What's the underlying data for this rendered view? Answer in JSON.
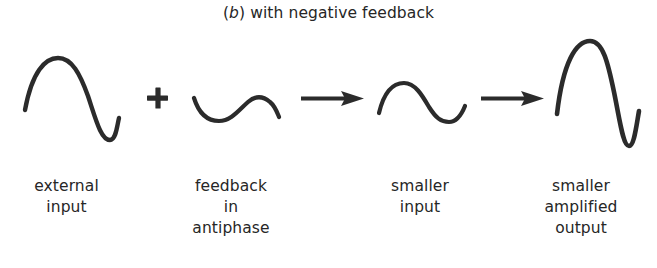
{
  "figure": {
    "caption": {
      "prefix": "(",
      "symbol": "b",
      "suffix": ")",
      "text": " with negative feedback",
      "full": "(b) with negative feedback"
    },
    "background_color": "#ffffff",
    "ink_color": "#2b2b2b",
    "operators": [
      {
        "name": "plus",
        "glyph": "+"
      },
      {
        "name": "arrow-1",
        "glyph": "→"
      },
      {
        "name": "arrow-2",
        "glyph": "→"
      }
    ],
    "waveforms": [
      {
        "id": "external-input",
        "label": "external\ninput",
        "label_lines": [
          "external",
          "input"
        ],
        "shape": "sine",
        "phase": "in-phase",
        "amplitude": "large",
        "cycles": 1
      },
      {
        "id": "feedback-in-antiphase",
        "label": "feedback\nin\nantiphase",
        "label_lines": [
          "feedback",
          "in",
          "antiphase"
        ],
        "shape": "sine",
        "phase": "antiphase",
        "amplitude": "small",
        "cycles": 1
      },
      {
        "id": "smaller-input",
        "label": "smaller\ninput",
        "label_lines": [
          "smaller",
          "input"
        ],
        "shape": "sine",
        "phase": "in-phase",
        "amplitude": "medium-small",
        "cycles": 1
      },
      {
        "id": "smaller-amplified-output",
        "label": "smaller\namplified\noutput",
        "label_lines": [
          "smaller",
          "amplified",
          "output"
        ],
        "shape": "sine",
        "phase": "in-phase",
        "amplitude": "very-large",
        "cycles": 1
      }
    ]
  }
}
